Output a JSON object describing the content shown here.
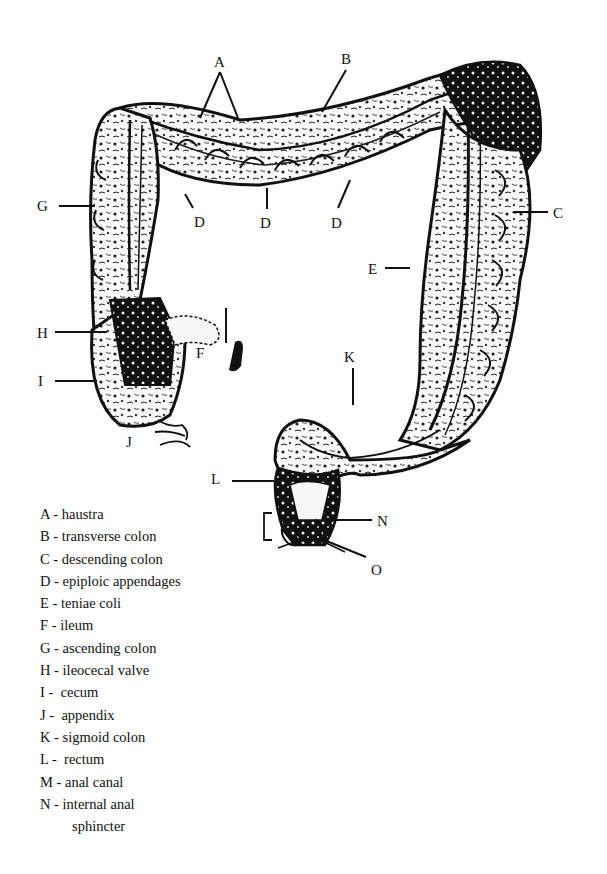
{
  "diagram": {
    "callouts": [
      {
        "letter": "A",
        "x": 214,
        "y": 55
      },
      {
        "letter": "B",
        "x": 341,
        "y": 52
      },
      {
        "letter": "C",
        "x": 553,
        "y": 206
      },
      {
        "letter": "D",
        "x": 194,
        "y": 215
      },
      {
        "letter": "D",
        "x": 260,
        "y": 216
      },
      {
        "letter": "D",
        "x": 331,
        "y": 216
      },
      {
        "letter": "E",
        "x": 368,
        "y": 262
      },
      {
        "letter": "F",
        "x": 196,
        "y": 346
      },
      {
        "letter": "G",
        "x": 37,
        "y": 199
      },
      {
        "letter": "H",
        "x": 37,
        "y": 326
      },
      {
        "letter": "I",
        "x": 38,
        "y": 374
      },
      {
        "letter": "J",
        "x": 126,
        "y": 435
      },
      {
        "letter": "K",
        "x": 344,
        "y": 350
      },
      {
        "letter": "L",
        "x": 211,
        "y": 472
      },
      {
        "letter": "N",
        "x": 377,
        "y": 514
      },
      {
        "letter": "O",
        "x": 371,
        "y": 563
      }
    ]
  },
  "legend": {
    "items": [
      {
        "letter": "A",
        "sep": " - ",
        "label": "haustra"
      },
      {
        "letter": "B",
        "sep": " - ",
        "label": "transverse colon"
      },
      {
        "letter": "C",
        "sep": " - ",
        "label": "descending colon"
      },
      {
        "letter": "D",
        "sep": " - ",
        "label": "epiploic appendages"
      },
      {
        "letter": "E",
        "sep": " - ",
        "label": "teniae coli"
      },
      {
        "letter": "F",
        "sep": " - ",
        "label": "ileum"
      },
      {
        "letter": "G",
        "sep": " - ",
        "label": "ascending colon"
      },
      {
        "letter": "H",
        "sep": " - ",
        "label": "ileocecal valve"
      },
      {
        "letter": "I",
        "sep": " -  ",
        "label": "cecum"
      },
      {
        "letter": "J",
        "sep": " -  ",
        "label": "appendix"
      },
      {
        "letter": "K",
        "sep": " - ",
        "label": "sigmoid colon"
      },
      {
        "letter": "L",
        "sep": " -  ",
        "label": "rectum"
      },
      {
        "letter": "M",
        "sep": " - ",
        "label": "anal canal"
      },
      {
        "letter": "N",
        "sep": " - ",
        "label": "internal anal",
        "continuation": "sphincter"
      }
    ]
  }
}
